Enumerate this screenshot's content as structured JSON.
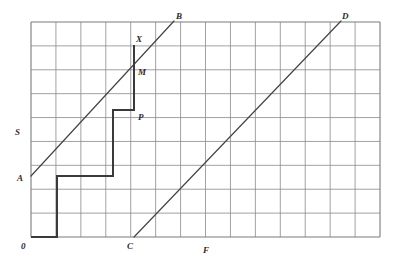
{
  "figure": {
    "title": "",
    "background_color": "#ffffff",
    "grid": {
      "x0": 31,
      "y0": 22,
      "cols": 14,
      "rows": 9,
      "cell_w": 24.93,
      "cell_h": 23.89,
      "line_color": "#8a8a8a",
      "border_color": "#7a7a7a"
    },
    "draw_color": "#3a3a3a",
    "curve_color": "#444444"
  },
  "labels": {
    "origin": "0",
    "y_axis": "S",
    "x_axis": "F",
    "point_a": "A",
    "point_b": "B",
    "point_c": "C",
    "point_d": "D",
    "point_m": "M",
    "point_p": "P",
    "point_x": "X"
  },
  "geometry": {
    "line_ab": {
      "name": "A-B",
      "x1": 31,
      "y1": 176,
      "x2": 174,
      "y2": 21
    },
    "line_cd": {
      "name": "C-D",
      "x1": 134,
      "y1": 237,
      "x2": 341,
      "y2": 21
    },
    "step_path": {
      "name": "step-curve",
      "points": [
        [
          31,
          237
        ],
        [
          57,
          237
        ],
        [
          57,
          176
        ],
        [
          113,
          176
        ],
        [
          113,
          110
        ],
        [
          134,
          110
        ],
        [
          134,
          45
        ]
      ]
    }
  },
  "label_positions": {
    "origin": {
      "x": 21,
      "y": 249
    },
    "y_axis": {
      "x": 15,
      "y": 135
    },
    "x_axis": {
      "x": 203,
      "y": 253
    },
    "point_a": {
      "x": 17,
      "y": 181
    },
    "point_b": {
      "x": 176,
      "y": 19
    },
    "point_c": {
      "x": 127,
      "y": 249
    },
    "point_d": {
      "x": 342,
      "y": 19
    },
    "point_m": {
      "x": 138,
      "y": 75
    },
    "point_p": {
      "x": 138,
      "y": 120
    },
    "point_x": {
      "x": 136,
      "y": 42
    }
  }
}
